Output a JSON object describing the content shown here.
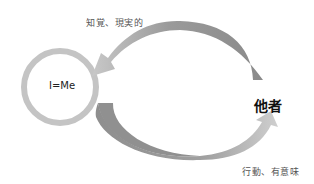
{
  "diagram": {
    "self_node": {
      "label": "I=Me"
    },
    "other_node": {
      "label": "他者"
    },
    "top_arrow": {
      "label": "知覚、現実的",
      "direction": "other-to-self"
    },
    "bottom_arrow": {
      "label": "行動、有意味",
      "direction": "self-to-other"
    }
  },
  "colors": {
    "background": "#ffffff",
    "circle_stroke": "#c4c4c4",
    "arrow_light": "#d0d0d0",
    "arrow_dark": "#8c8c8c",
    "text": "#333333"
  }
}
